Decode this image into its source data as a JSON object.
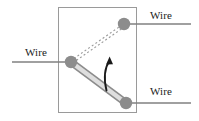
{
  "figure": {
    "type": "physics-schematic",
    "colors": {
      "frame": "#9a9a9a",
      "wire": "#808080",
      "node": "#8c8c8c",
      "bar_fill": "#d8d8d8",
      "bar_stroke": "#8c8c8c",
      "dashed": "#9a9a9a",
      "arrow": "#1a1a1a",
      "text": "#1c1c1c",
      "background": "#ffffff"
    },
    "enclosure": {
      "x": 58,
      "y": 7,
      "width": 78,
      "height": 106
    },
    "labels": [
      {
        "id": "wire-left",
        "text": "Wire",
        "x": 25,
        "y": 46
      },
      {
        "id": "wire-top-right",
        "text": "Wire",
        "x": 150,
        "y": 9
      },
      {
        "id": "wire-bottom-right",
        "text": "Wire",
        "x": 150,
        "y": 85
      }
    ],
    "nodes": [
      {
        "id": "pivot",
        "cx": 71,
        "cy": 62,
        "r": 6.2
      },
      {
        "id": "contact-top",
        "cx": 124,
        "cy": 24,
        "r": 6.2
      },
      {
        "id": "contact-bottom",
        "cx": 126,
        "cy": 103,
        "r": 6.2
      }
    ],
    "wires": [
      {
        "id": "wire-left-lead",
        "x1": 12,
        "y1": 62,
        "x2": 71,
        "y2": 62
      },
      {
        "id": "wire-top-right-lead",
        "x1": 124,
        "y1": 24,
        "x2": 191,
        "y2": 24
      },
      {
        "id": "wire-bottom-right-lead",
        "x1": 126,
        "y1": 103,
        "x2": 191,
        "y2": 103
      }
    ],
    "bar": {
      "id": "rotating-bar",
      "from": {
        "x": 71,
        "y": 62
      },
      "to": {
        "x": 126,
        "y": 103
      },
      "thickness": 6
    },
    "ghost_bar": {
      "id": "bar-dashed-previous-position",
      "from": {
        "x": 71,
        "y": 62
      },
      "to": {
        "x": 124,
        "y": 24
      },
      "thickness": 6,
      "style": "dashed"
    },
    "arrow": {
      "id": "rotation-arrow",
      "direction": "counterclockwise-upward",
      "from": {
        "x": 107,
        "y": 90
      },
      "to": {
        "x": 110,
        "y": 58
      }
    }
  }
}
